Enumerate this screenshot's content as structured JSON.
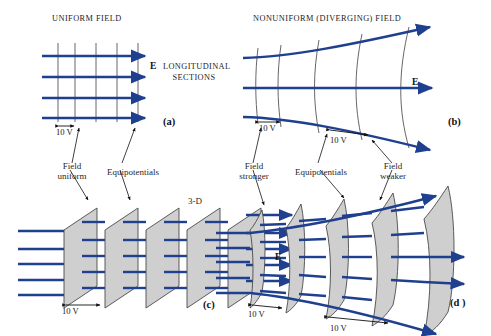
{
  "figure": {
    "titles": {
      "left": "UNIFORM FIELD",
      "right": "NONUNIFORM (DIVERGING) FIELD"
    },
    "center_label_line1": "LONGITUDINAL",
    "center_label_line2": "SECTIONS",
    "three_d_label": "3-D",
    "field_symbol": "E",
    "voltage_label": "10 V"
  },
  "panels": [
    {
      "id": "a",
      "marker": "(a)",
      "type": "uniform-longitudinal-section",
      "field_lines": 4,
      "equipotential_lines": 5,
      "spacing_label": "10 V",
      "field_symbol": "E",
      "annotations": [
        {
          "text_line1": "Field",
          "text_line2": "uniform"
        },
        {
          "text_line1": "Equipotentials",
          "text_line2": ""
        }
      ]
    },
    {
      "id": "b",
      "marker": "(b)",
      "type": "nonuniform-longitudinal-section",
      "field_lines": 3,
      "equipotential_lines": 5,
      "spacing_labels": [
        "10 V",
        "10 V"
      ],
      "field_symbol": "E",
      "annotations": [
        {
          "text_line1": "Field",
          "text_line2": "stronger"
        },
        {
          "text_line1": "Equipotentials",
          "text_line2": ""
        },
        {
          "text_line1": "Field",
          "text_line2": "weaker"
        }
      ]
    },
    {
      "id": "c",
      "marker": "(c)",
      "type": "uniform-3d",
      "surfaces": 5,
      "field_lines": 5,
      "spacing_label": "10 V",
      "field_symbol": "E"
    },
    {
      "id": "d",
      "marker": "(d )",
      "type": "nonuniform-3d",
      "surfaces": 5,
      "field_lines": 5,
      "spacing_labels": [
        "10 V",
        "10 V"
      ]
    }
  ],
  "colors": {
    "field_blue": "#1f3f8f",
    "equipotential_gray": "#555555",
    "surface_fill": "#cfcfcf",
    "surface_edge": "#4a4a4a",
    "text": "#1a1a1a",
    "background": "#ffffff"
  }
}
